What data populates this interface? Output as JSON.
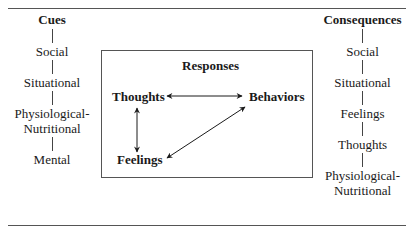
{
  "cues": {
    "title": "Cues",
    "items": [
      "Social",
      "Situational",
      "Physiological-\nNutritional",
      "Mental"
    ]
  },
  "responses": {
    "title": "Responses",
    "nodes": {
      "thoughts": "Thoughts",
      "behaviors": "Behaviors",
      "feelings": "Feelings"
    },
    "edges": [
      {
        "from": "thoughts",
        "to": "behaviors",
        "type": "bidirectional"
      },
      {
        "from": "thoughts",
        "to": "feelings",
        "type": "bidirectional"
      },
      {
        "from": "feelings",
        "to": "behaviors",
        "type": "bidirectional"
      }
    ]
  },
  "consequences": {
    "title": "Consequences",
    "items": [
      "Social",
      "Situational",
      "Feelings",
      "Thoughts",
      "Physiological-\nNutritional"
    ]
  }
}
